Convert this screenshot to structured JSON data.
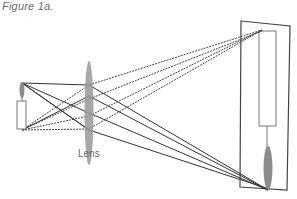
{
  "figure": {
    "caption": "Figure 1a.",
    "lens_label": "Lens"
  },
  "diagram": {
    "elements": [
      "object-candle",
      "object-flame",
      "lens",
      "screen",
      "image-candle",
      "image-flame",
      "light-rays"
    ],
    "colors": {
      "line": "#333333",
      "dashed_line": "#555555",
      "lens_fill": "#999999",
      "flame_fill": "#8c8c8c",
      "text": "#6a6a6a"
    }
  }
}
